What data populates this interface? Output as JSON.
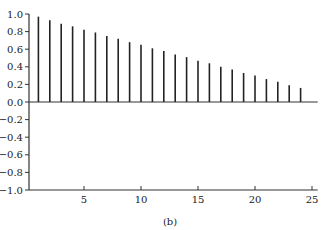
{
  "chart_data": {
    "type": "bar",
    "subtype": "stem",
    "title": "",
    "caption": "(b)",
    "xlabel": "",
    "ylabel": "",
    "x": [
      1,
      2,
      3,
      4,
      5,
      6,
      7,
      8,
      9,
      10,
      11,
      12,
      13,
      14,
      15,
      16,
      17,
      18,
      19,
      20,
      21,
      22,
      23,
      24
    ],
    "values": [
      0.97,
      0.93,
      0.89,
      0.86,
      0.82,
      0.79,
      0.75,
      0.72,
      0.68,
      0.65,
      0.61,
      0.58,
      0.54,
      0.51,
      0.47,
      0.44,
      0.4,
      0.37,
      0.33,
      0.3,
      0.26,
      0.23,
      0.19,
      0.16
    ],
    "xlim": [
      0.2,
      25.5
    ],
    "ylim": [
      -1.0,
      1.0
    ],
    "xticks": [
      5,
      10,
      15,
      20,
      25
    ],
    "xtick_labels": [
      "5",
      "10",
      "15",
      "20",
      "25"
    ],
    "yticks": [
      1.0,
      0.8,
      0.6,
      0.4,
      0.2,
      0.0,
      -0.2,
      -0.4,
      -0.6,
      -0.8,
      -1.0
    ],
    "ytick_labels": [
      "1.0",
      "0.8",
      "0.6",
      "0.4",
      "0.2",
      "0.0",
      "−0.2",
      "−0.4",
      "−0.6",
      "−0.8",
      "−1.0"
    ],
    "grid": false,
    "legend": null,
    "zero_line": true,
    "colors": {
      "stem": "#222222",
      "axis": "#333333"
    }
  }
}
